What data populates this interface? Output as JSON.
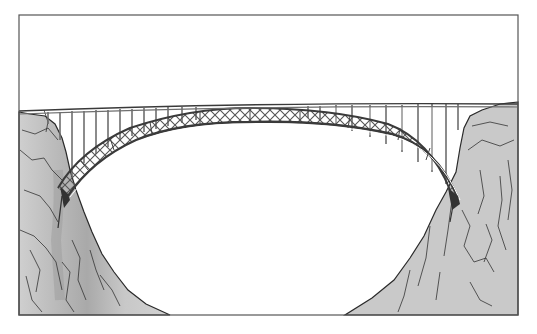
{
  "illustration": {
    "subject": "steel arch bridge spanning a rocky gorge",
    "style": "black ink line drawing with gray tone",
    "colors": {
      "background": "#ffffff",
      "frame": "#555555",
      "rock_fill": "#c9c9c9",
      "rock_shadow": "#a8a8a8",
      "ink": "#2a2a2a",
      "steel": "#6e6e6e"
    },
    "frame": {
      "x": 19,
      "y": 15,
      "width": 499,
      "height": 300
    },
    "deck": {
      "left_y": 111,
      "mid_y": 106,
      "right_y": 104
    },
    "arch": {
      "left_base": [
        63,
        192
      ],
      "crown": [
        250,
        112
      ],
      "right_base": [
        452,
        198
      ]
    },
    "column_count": 30
  }
}
